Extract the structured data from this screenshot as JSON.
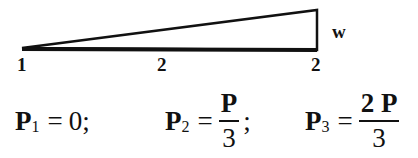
{
  "diagram": {
    "shape": "triangular-load",
    "side_label": "w",
    "node_labels": [
      "1",
      "2",
      "2"
    ]
  },
  "equations": [
    {
      "lhs": "P",
      "sub": "1",
      "op": "=",
      "rhs": "0",
      "suffix": ";"
    },
    {
      "lhs": "P",
      "sub": "2",
      "op": "=",
      "num": "P",
      "den": "3",
      "suffix": ";"
    },
    {
      "lhs": "P",
      "sub": "3",
      "op": "=",
      "num": "2 P",
      "den": "3",
      "suffix": ""
    }
  ]
}
